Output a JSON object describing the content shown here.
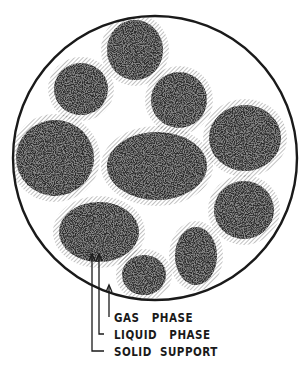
{
  "figure": {
    "colors": {
      "outline": "#1a1a1a",
      "particle": "#2a2a2a",
      "hatch": "#555555",
      "background": "#ffffff"
    },
    "container": {
      "shape": "circle",
      "cx": 155,
      "cy": 158,
      "r": 142
    },
    "particles": [
      {
        "name": "top-center",
        "cx": 135,
        "cy": 50,
        "rx": 28,
        "ry": 30
      },
      {
        "name": "upper-left",
        "cx": 81,
        "cy": 89,
        "rx": 27,
        "ry": 26
      },
      {
        "name": "upper-right",
        "cx": 179,
        "cy": 100,
        "rx": 28,
        "ry": 28
      },
      {
        "name": "left",
        "cx": 55,
        "cy": 158,
        "rx": 39,
        "ry": 38
      },
      {
        "name": "center",
        "cx": 157,
        "cy": 166,
        "rx": 50,
        "ry": 34
      },
      {
        "name": "right",
        "cx": 245,
        "cy": 138,
        "rx": 36,
        "ry": 33
      },
      {
        "name": "lower-right",
        "cx": 244,
        "cy": 210,
        "rx": 30,
        "ry": 29
      },
      {
        "name": "lower-left",
        "cx": 99,
        "cy": 232,
        "rx": 40,
        "ry": 30
      },
      {
        "name": "bottom-center-right",
        "cx": 196,
        "cy": 256,
        "rx": 21,
        "ry": 29
      },
      {
        "name": "bottom-center",
        "cx": 144,
        "cy": 275,
        "rx": 22,
        "ry": 20
      }
    ]
  },
  "labels": {
    "gas_phase": "GAS   PHASE",
    "liquid_phase": "LIQUID   PHASE",
    "solid_support": "SOLID  SUPPORT"
  }
}
